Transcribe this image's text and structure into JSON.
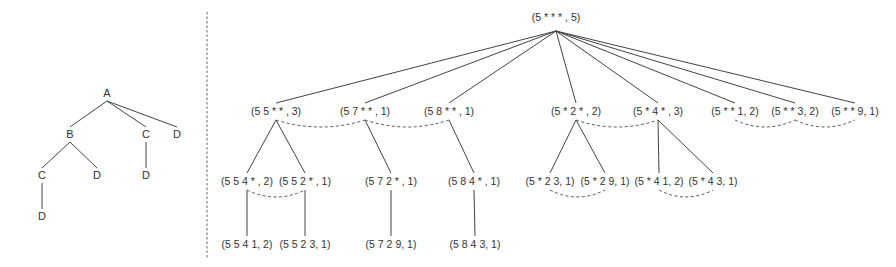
{
  "left_tree": {
    "nodes": [
      {
        "id": "A",
        "label": "A",
        "x": 107,
        "y": 97
      },
      {
        "id": "B",
        "label": "B",
        "x": 70,
        "y": 138
      },
      {
        "id": "C1",
        "label": "C",
        "x": 146,
        "y": 138
      },
      {
        "id": "D1",
        "label": "D",
        "x": 177,
        "y": 138
      },
      {
        "id": "C2",
        "label": "C",
        "x": 42,
        "y": 179
      },
      {
        "id": "D2",
        "label": "D",
        "x": 97,
        "y": 179
      },
      {
        "id": "D3",
        "label": "D",
        "x": 146,
        "y": 179
      },
      {
        "id": "D4",
        "label": "D",
        "x": 42,
        "y": 220
      }
    ],
    "edges": [
      [
        "A",
        "B"
      ],
      [
        "A",
        "C1"
      ],
      [
        "A",
        "D1"
      ],
      [
        "B",
        "C2"
      ],
      [
        "B",
        "D2"
      ],
      [
        "C1",
        "D3"
      ],
      [
        "C2",
        "D4"
      ]
    ]
  },
  "right_tree": {
    "root": {
      "id": "r",
      "label": "(5 * * * , 5)",
      "x": 556,
      "y": 21
    },
    "level1": [
      {
        "id": "n55",
        "label": "(5 5 * * , 3)",
        "x": 276,
        "y": 115
      },
      {
        "id": "n57",
        "label": "(5 7 * * , 1)",
        "x": 365,
        "y": 115
      },
      {
        "id": "n58",
        "label": "(5 8 * * , 1)",
        "x": 449,
        "y": 115
      },
      {
        "id": "n5x2",
        "label": "(5 * 2 * , 2)",
        "x": 576,
        "y": 115
      },
      {
        "id": "n5x4",
        "label": "(5 * 4 * , 3)",
        "x": 658,
        "y": 115
      },
      {
        "id": "n5xx1",
        "label": "(5 * * 1, 2)",
        "x": 735,
        "y": 115
      },
      {
        "id": "n5xx3",
        "label": "(5 * * 3, 2)",
        "x": 795,
        "y": 115
      },
      {
        "id": "n5xx9",
        "label": "(5 * * 9, 1)",
        "x": 855,
        "y": 115
      }
    ],
    "level2": [
      {
        "id": "n554",
        "label": "(5 5 4 * , 2)",
        "parent": "n55",
        "x": 247,
        "y": 185
      },
      {
        "id": "n552",
        "label": "(5 5 2 * , 1)",
        "parent": "n55",
        "x": 305,
        "y": 185
      },
      {
        "id": "n572",
        "label": "(5 7 2 * , 1)",
        "parent": "n57",
        "x": 391,
        "y": 185
      },
      {
        "id": "n584",
        "label": "(5 8 4 * , 1)",
        "parent": "n58",
        "x": 474,
        "y": 185
      },
      {
        "id": "n5x23",
        "label": "(5 * 2 3, 1)",
        "parent": "n5x2",
        "x": 550,
        "y": 185
      },
      {
        "id": "n5x29",
        "label": "(5 * 2 9, 1)",
        "parent": "n5x2",
        "x": 605,
        "y": 185
      },
      {
        "id": "n5x41",
        "label": "(5 * 4 1, 2)",
        "parent": "n5x4",
        "x": 659,
        "y": 185
      },
      {
        "id": "n5x43",
        "label": "(5 * 4 3, 1)",
        "parent": "n5x4",
        "x": 713,
        "y": 185
      }
    ],
    "level3": [
      {
        "id": "n5541",
        "label": "(5 5 4 1, 2)",
        "parent": "n554",
        "x": 247,
        "y": 248
      },
      {
        "id": "n5523",
        "label": "(5 5 2 3, 1)",
        "parent": "n552",
        "x": 305,
        "y": 248
      },
      {
        "id": "n5729",
        "label": "(5 7 2 9, 1)",
        "parent": "n572",
        "x": 391,
        "y": 248
      },
      {
        "id": "n5843",
        "label": "(5 8 4 3, 1)",
        "parent": "n584",
        "x": 475,
        "y": 248
      }
    ],
    "sibling_links": [
      [
        "n55",
        "n57"
      ],
      [
        "n57",
        "n58"
      ],
      [
        "n5x2",
        "n5x4"
      ],
      [
        "n5xx1",
        "n5xx3"
      ],
      [
        "n5xx3",
        "n5xx9"
      ],
      [
        "n554",
        "n552"
      ],
      [
        "n5x23",
        "n5x29"
      ],
      [
        "n5x41",
        "n5x43"
      ]
    ]
  },
  "divider": {
    "x": 207,
    "style": "dashed"
  }
}
